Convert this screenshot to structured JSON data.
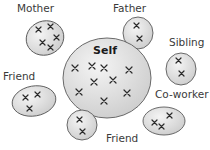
{
  "diagram": {
    "type": "social-network-ellipses",
    "center": {
      "label": "Self",
      "x_count": 9
    },
    "nodes": [
      {
        "id": "mother",
        "label": "Mother",
        "x_count": 5
      },
      {
        "id": "father",
        "label": "Father",
        "x_count": 2
      },
      {
        "id": "sibling",
        "label": "Sibling",
        "x_count": 2
      },
      {
        "id": "friend-left",
        "label": "Friend",
        "x_count": 3
      },
      {
        "id": "friend-bottom",
        "label": "Friend",
        "x_count": 2
      },
      {
        "id": "coworker",
        "label": "Co-worker",
        "x_count": 3
      }
    ],
    "colors": {
      "fill_light": "#f2f2f2",
      "fill_dark": "#cfcfcf",
      "stroke": "#5a5a5a",
      "mark": "#2b2b2b",
      "text": "#3a3a3a"
    }
  }
}
